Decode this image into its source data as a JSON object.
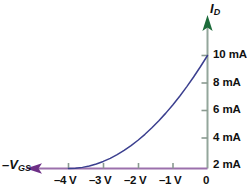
{
  "chart_data": {
    "type": "line",
    "title": "",
    "subtitle": "",
    "xlabel": "–V",
    "xlabel_sub": "GS",
    "ylabel": "I",
    "ylabel_sub": "D",
    "xlabel_full": "–V_GS",
    "ylabel_full": "I_D",
    "grid": false,
    "legend": "none",
    "xlim": [
      -4.6,
      0.35
    ],
    "ylim": [
      0,
      11.6
    ],
    "x_tick_values": [
      -4,
      -3,
      -2,
      -1,
      0
    ],
    "x_tick_labels": [
      "–4 V",
      "–3 V",
      "–2 V",
      "–1 V",
      "0"
    ],
    "y_tick_values": [
      2,
      4,
      6,
      8,
      10
    ],
    "y_tick_labels": [
      "2 mA",
      "4 mA",
      "6 mA",
      "8 mA",
      "10 mA"
    ],
    "y_units": "mA",
    "x_units": "V",
    "series": [
      {
        "name": "drain current transfer curve",
        "x": [
          -4.0,
          -3.8,
          -3.6,
          -3.4,
          -3.2,
          -3.0,
          -2.8,
          -2.6,
          -2.4,
          -2.2,
          -2.0,
          -1.8,
          -1.6,
          -1.4,
          -1.2,
          -1.0,
          -0.8,
          -0.6,
          -0.4,
          -0.2,
          0.0
        ],
        "y": [
          0.0,
          0.025,
          0.1,
          0.225,
          0.4,
          0.625,
          0.9,
          1.225,
          1.6,
          2.025,
          2.5,
          3.025,
          3.6,
          4.225,
          4.9,
          5.625,
          6.4,
          7.225,
          8.1,
          9.025,
          10.0
        ],
        "equation": "I_D = I_DSS (1 - V_GS/V_GS(off))^2",
        "color": "#3b3f8f"
      }
    ],
    "annotations": {
      "pinch_off_voltage": "–4 V",
      "idss": "10 mA"
    },
    "colors": {
      "curve": "#3b3f8f",
      "y_axis": "#93a69b",
      "y_arrow": "#1c6b3a",
      "x_axis": "#9b70ac",
      "x_arrow": "#6d2f86",
      "tick": "#8a9a90",
      "text": "#111111",
      "background": "#ffffff"
    }
  },
  "axes": {
    "y_axis_name": "I",
    "y_axis_sub": "D",
    "x_axis_name": "–V",
    "x_axis_sub": "GS"
  },
  "y_ticks": [
    {
      "label": "10 mA",
      "value": 10
    },
    {
      "label": "8 mA",
      "value": 8
    },
    {
      "label": "6 mA",
      "value": 6
    },
    {
      "label": "4 mA",
      "value": 4
    },
    {
      "label": "2 mA",
      "value": 2
    }
  ],
  "x_ticks": [
    {
      "label": "–4 V",
      "value": -4
    },
    {
      "label": "–3 V",
      "value": -3
    },
    {
      "label": "–2 V",
      "value": -2
    },
    {
      "label": "–1 V",
      "value": -1
    },
    {
      "label": "0",
      "value": 0
    }
  ]
}
